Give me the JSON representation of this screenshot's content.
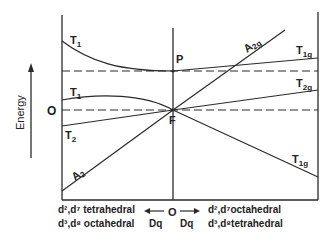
{
  "diagram": {
    "y_axis_label": "Energy",
    "zero_label": "O",
    "points": {
      "P": "P",
      "F": "F"
    },
    "left_levels": [
      {
        "term": "T",
        "sub": "1",
        "origin": "P"
      },
      {
        "term": "T",
        "sub": "1",
        "origin": "F"
      },
      {
        "term": "T",
        "sub": "2",
        "origin": "F"
      },
      {
        "term": "A",
        "sub": "2",
        "origin": "F"
      }
    ],
    "right_levels": [
      {
        "term": "A",
        "sub": "2g",
        "origin": "F"
      },
      {
        "term": "T",
        "sub": "1g",
        "origin": "P"
      },
      {
        "term": "T",
        "sub": "2g",
        "origin": "F"
      },
      {
        "term": "T",
        "sub": "1g",
        "origin": "F"
      }
    ],
    "bottom": {
      "left_line1": "d²,d⁷ tetrahedral",
      "left_line2": "d³,d⁸ octahedral",
      "center": "O",
      "dq_left": "Dq",
      "dq_right": "Dq",
      "right_line1": "d²,d⁷octahedral",
      "right_line2": "d³,d⁸tetrahedral"
    },
    "colors": {
      "line": "#2a2a2a",
      "background": "#ffffff"
    }
  }
}
